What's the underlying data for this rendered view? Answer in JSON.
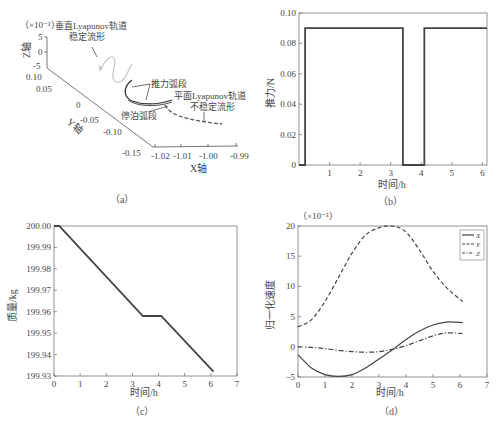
{
  "figure": {
    "top_text_partial": "",
    "bottom_text_partial": ""
  },
  "chart_data": [
    {
      "panel": "a",
      "caption": "（a）",
      "type": "line",
      "title": "",
      "projection": "3d",
      "xlabel": "X轴",
      "ylabel": "Y轴",
      "zlabel": "Z轴",
      "z_scale_note": "（×10⁻³）",
      "x_ticks": [
        "-1.02",
        "-1.01",
        "-1.00",
        "-0.99"
      ],
      "y_ticks": [
        "0.10",
        "0.05",
        "0",
        "-0.05",
        "-0.10",
        "-0.15"
      ],
      "z_ticks": [
        "5",
        "0",
        "-5"
      ],
      "annotations": [
        {
          "text_line1": "垂直Lyapunov轨道",
          "text_line2": "稳定流形"
        },
        {
          "text_line1": "推力弧段"
        },
        {
          "text_line1": "平面Lyapunov轨道",
          "text_line2": "不稳定流形"
        },
        {
          "text_line1": "停泊弧段"
        }
      ]
    },
    {
      "panel": "b",
      "caption": "（b）",
      "type": "line",
      "title": "",
      "xlabel": "时间/h",
      "ylabel": "推力/N",
      "xlim": [
        0,
        6.15
      ],
      "ylim": [
        0,
        0.1
      ],
      "x_ticks": [
        "1",
        "2",
        "3",
        "4",
        "5",
        "6"
      ],
      "y_ticks": [
        "0",
        "0.02",
        "0.04",
        "0.06",
        "0.08",
        "0.10"
      ],
      "x": [
        0,
        0.2,
        0.2,
        3.4,
        3.4,
        4.1,
        4.1,
        6.15
      ],
      "values": [
        0,
        0,
        0.09,
        0.09,
        0,
        0,
        0.09,
        0.09
      ]
    },
    {
      "panel": "c",
      "caption": "（c）",
      "type": "line",
      "title": "",
      "xlabel": "时间/h",
      "ylabel": "质量/kg",
      "xlim": [
        0,
        7
      ],
      "ylim": [
        199.93,
        200.0
      ],
      "x_ticks": [
        "0",
        "1",
        "2",
        "3",
        "4",
        "5",
        "6",
        "7"
      ],
      "y_ticks": [
        "200.00",
        "199.99",
        "199.98",
        "199.97",
        "199.96",
        "199.95",
        "199.94",
        "199.93"
      ],
      "x": [
        0,
        0.2,
        3.4,
        4.1,
        6.1
      ],
      "values": [
        200.0,
        200.0,
        199.958,
        199.958,
        199.932
      ]
    },
    {
      "panel": "d",
      "caption": "（d）",
      "type": "line",
      "title": "",
      "xlabel": "时间/h",
      "ylabel": "归一化速度",
      "scale_note": "（×10⁻³）",
      "xlim": [
        0,
        7
      ],
      "ylim": [
        -5,
        20
      ],
      "x_ticks": [
        "0",
        "1",
        "2",
        "3",
        "4",
        "5",
        "6",
        "7"
      ],
      "y_ticks": [
        "20",
        "15",
        "10",
        "5",
        "0",
        "-5"
      ],
      "legend": [
        "X",
        "Y",
        "Z"
      ],
      "legend_position": "upper right",
      "x": [
        0,
        0.5,
        1.0,
        1.5,
        2.0,
        2.5,
        3.0,
        3.5,
        4.0,
        4.5,
        5.0,
        5.5,
        6.1
      ],
      "series": [
        {
          "name": "X",
          "style": "solid",
          "values": [
            -1.3,
            -3.5,
            -4.6,
            -4.9,
            -4.6,
            -3.5,
            -2.0,
            -0.5,
            1.2,
            2.6,
            3.6,
            4.1,
            4.0
          ]
        },
        {
          "name": "Y",
          "style": "dashed",
          "values": [
            3.3,
            4.5,
            7.5,
            11.5,
            15.5,
            18.5,
            19.7,
            20.0,
            19.0,
            16.0,
            12.5,
            9.8,
            7.5
          ]
        },
        {
          "name": "Z",
          "style": "dash-dot",
          "values": [
            0.0,
            -0.1,
            -0.3,
            -0.6,
            -0.8,
            -0.9,
            -0.8,
            -0.4,
            0.2,
            1.0,
            1.8,
            2.3,
            2.2
          ]
        }
      ]
    }
  ]
}
